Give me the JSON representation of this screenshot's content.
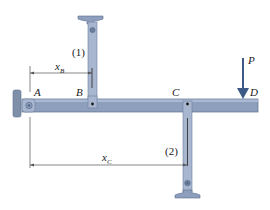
{
  "diagram": {
    "points": {
      "A": "A",
      "B": "B",
      "C": "C",
      "D": "D"
    },
    "members": {
      "member1": "(1)",
      "member2": "(2)"
    },
    "load": {
      "label": "P"
    },
    "dimensions": {
      "xB": {
        "main": "x",
        "sub": "B"
      },
      "xC": {
        "main": "x",
        "sub": "C"
      }
    },
    "colors": {
      "bar_fill": "#8d9fbd",
      "bar_edge": "#5c6f8e",
      "bar_highlight": "#b3c1d8",
      "support_fill": "#7f8fa8",
      "arrow": "#3d5a86",
      "dimension_line": "#555555",
      "text": "#1a1a1a"
    }
  }
}
